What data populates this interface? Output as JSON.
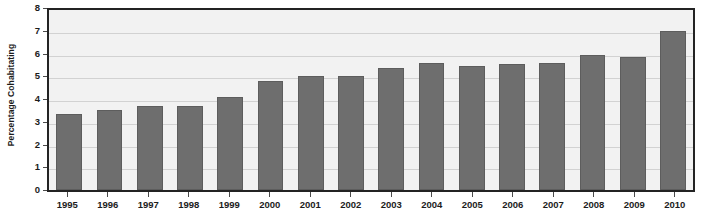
{
  "chart_data": {
    "type": "bar",
    "title": "",
    "subtitle": "",
    "xlabel": "",
    "ylabel": "Percentage Cohabitating",
    "categories": [
      "1995",
      "1996",
      "1997",
      "1998",
      "1999",
      "2000",
      "2001",
      "2002",
      "2003",
      "2004",
      "2005",
      "2006",
      "2007",
      "2008",
      "2009",
      "2010"
    ],
    "values": [
      3.35,
      3.5,
      3.7,
      3.7,
      4.1,
      4.8,
      5.0,
      5.0,
      5.35,
      5.6,
      5.45,
      5.55,
      5.6,
      5.95,
      5.85,
      7.0
    ],
    "series": [
      {
        "name": "Percentage Cohabitating",
        "values": [
          3.35,
          3.5,
          3.7,
          3.7,
          4.1,
          4.8,
          5.0,
          5.0,
          5.35,
          5.6,
          5.45,
          5.55,
          5.6,
          5.95,
          5.85,
          7.0
        ]
      }
    ],
    "ylim": [
      0,
      8
    ],
    "ytick_labels": [
      "0",
      "1",
      "2",
      "3",
      "4",
      "5",
      "6",
      "7",
      "8"
    ],
    "ytick_values": [
      0,
      1,
      2,
      3,
      4,
      5,
      6,
      7,
      8
    ],
    "grid": true,
    "grid_axis": "y",
    "legend": false,
    "legend_position": "none",
    "annotations": [],
    "colors": {
      "bar_fill": "#6e6e6e",
      "bar_border": "#5d5d5d",
      "plot_background": "#f2f2f2",
      "page_background": "#ffffff",
      "axis_line": "#232323",
      "gridline": "#d2d2d2",
      "text": "#1c1c1c"
    }
  }
}
